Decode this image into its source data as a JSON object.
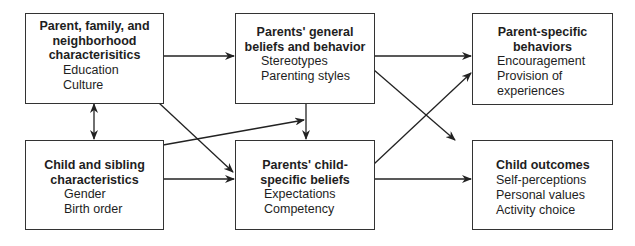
{
  "diagram": {
    "boxes": [
      {
        "id": "parent-family",
        "title": "Parent, family, and neighborhood characterisitics",
        "title_lines": [
          "Parent, family, and",
          "neighborhood",
          "characterisitics"
        ],
        "items": [
          "Education",
          "Culture"
        ]
      },
      {
        "id": "general-beliefs",
        "title": "Parents' general beliefs and behavior",
        "title_lines": [
          "Parents' general",
          "beliefs and behavior"
        ],
        "items": [
          "Stereotypes",
          "Parenting styles"
        ]
      },
      {
        "id": "parent-behaviors",
        "title": "Parent-specific behaviors",
        "title_lines": [
          "Parent-specific",
          "behaviors"
        ],
        "items": [
          "Encouragement",
          "Provision of",
          "experiences"
        ]
      },
      {
        "id": "child-sibling",
        "title": "Child and sibling characteristics",
        "title_lines": [
          "Child and sibling",
          "characteristics"
        ],
        "items": [
          "Gender",
          "Birth order"
        ]
      },
      {
        "id": "child-specific-beliefs",
        "title": "Parents' child-specific beliefs",
        "title_lines": [
          "Parents' child-",
          "specific beliefs"
        ],
        "items": [
          "Expectations",
          "Competency"
        ]
      },
      {
        "id": "child-outcomes",
        "title": "Child outcomes",
        "title_lines": [
          "Child outcomes"
        ],
        "items": [
          "Self-perceptions",
          "Personal values",
          "Activity choice"
        ]
      }
    ],
    "edges": [
      {
        "from": "parent-family",
        "to": "general-beliefs"
      },
      {
        "from": "parent-family",
        "to": "child-specific-beliefs"
      },
      {
        "from": "parent-family",
        "to": "child-sibling",
        "bidirectional": true
      },
      {
        "from": "child-sibling",
        "to": "general-beliefs"
      },
      {
        "from": "child-sibling",
        "to": "child-specific-beliefs"
      },
      {
        "from": "general-beliefs",
        "to": "child-specific-beliefs"
      },
      {
        "from": "general-beliefs",
        "to": "parent-behaviors"
      },
      {
        "from": "general-beliefs",
        "to": "child-outcomes"
      },
      {
        "from": "child-specific-beliefs",
        "to": "parent-behaviors"
      },
      {
        "from": "child-specific-beliefs",
        "to": "child-outcomes"
      }
    ]
  }
}
